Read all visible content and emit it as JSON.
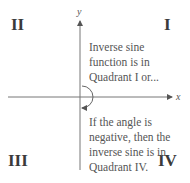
{
  "diagram": {
    "quadrant_labels": {
      "q1": "I",
      "q2": "II",
      "q3": "III",
      "q4": "IV"
    },
    "axis_labels": {
      "x": "x",
      "y": "y"
    },
    "notes": {
      "upper": "Inverse sine\nfunction is in\nQuadrant I or...",
      "lower": "If the angle is\nnegative, then the\ninverse sine is in\nQuadrant IV."
    },
    "colors": {
      "axis": "#555555",
      "text": "#3a3a3a"
    }
  }
}
